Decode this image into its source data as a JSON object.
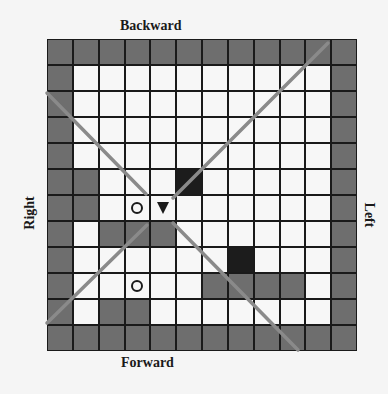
{
  "labels": {
    "top": "Backward",
    "bottom": "Forward",
    "left_side": "Right",
    "right_side": "Left"
  },
  "colors": {
    "wall": "#6e6e6e",
    "obstacle": "#1c1c1c",
    "free": "#f7f7f7",
    "grid_line": "#1a1a1a",
    "view_line": "#8a8a8a"
  },
  "legend_codes": {
    "g": "gray wall cell",
    "w": "white free cell",
    "b": "black obstacle cell",
    "o": "circle target marker",
    "t": "agent triangle pointing down"
  },
  "grid": {
    "rows": 12,
    "cols": 12,
    "cells": [
      [
        "g",
        "g",
        "g",
        "g",
        "g",
        "g",
        "g",
        "g",
        "g",
        "g",
        "g",
        "g"
      ],
      [
        "g",
        "w",
        "w",
        "w",
        "w",
        "w",
        "w",
        "w",
        "w",
        "w",
        "w",
        "g"
      ],
      [
        "g",
        "w",
        "w",
        "w",
        "w",
        "w",
        "w",
        "w",
        "w",
        "w",
        "w",
        "g"
      ],
      [
        "g",
        "w",
        "w",
        "w",
        "w",
        "w",
        "w",
        "w",
        "w",
        "w",
        "w",
        "g"
      ],
      [
        "g",
        "w",
        "w",
        "w",
        "w",
        "w",
        "w",
        "w",
        "w",
        "w",
        "w",
        "g"
      ],
      [
        "g",
        "g",
        "w",
        "w",
        "w",
        "b",
        "w",
        "w",
        "w",
        "w",
        "w",
        "g"
      ],
      [
        "g",
        "g",
        "w",
        "o",
        "t",
        "w",
        "w",
        "w",
        "w",
        "w",
        "w",
        "g"
      ],
      [
        "g",
        "w",
        "g",
        "g",
        "g",
        "w",
        "w",
        "w",
        "w",
        "w",
        "w",
        "g"
      ],
      [
        "g",
        "w",
        "w",
        "w",
        "w",
        "w",
        "w",
        "b",
        "w",
        "w",
        "w",
        "g"
      ],
      [
        "g",
        "w",
        "w",
        "o",
        "w",
        "w",
        "g",
        "g",
        "g",
        "g",
        "w",
        "g"
      ],
      [
        "g",
        "w",
        "g",
        "g",
        "w",
        "w",
        "w",
        "w",
        "w",
        "w",
        "w",
        "g"
      ],
      [
        "g",
        "g",
        "g",
        "g",
        "g",
        "g",
        "g",
        "g",
        "g",
        "g",
        "g",
        "g"
      ]
    ]
  },
  "agent": {
    "row": 6,
    "col": 4,
    "facing": "down"
  },
  "markers": [
    {
      "row": 6,
      "col": 3
    },
    {
      "row": 9,
      "col": 3
    }
  ],
  "view_lines": [
    {
      "x1": 47,
      "y1": 93,
      "x2": 146,
      "y2": 194
    },
    {
      "x1": 173,
      "y1": 223,
      "x2": 298,
      "y2": 350
    },
    {
      "x1": 47,
      "y1": 323,
      "x2": 147,
      "y2": 225
    },
    {
      "x1": 173,
      "y1": 198,
      "x2": 328,
      "y2": 43
    }
  ]
}
